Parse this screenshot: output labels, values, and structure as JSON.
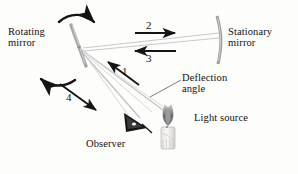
{
  "figure": {
    "type": "optics-diagram",
    "title_visible": false,
    "background_color": "#fdfdfc",
    "ink_color": "#111111",
    "ray_color": "#b9b9b9",
    "mirror_color": "#9a9a9a"
  },
  "labels": {
    "rotating_mirror": "Rotating\nmirror",
    "stationary_mirror": "Stationary\nmirror",
    "deflection_angle": "Deflection\nangle",
    "light_source": "Light source",
    "observer": "Observer"
  },
  "ray_numbers": {
    "one": "1",
    "two": "2",
    "three": "3",
    "four": "4"
  },
  "icons": {
    "rotating_mirror": "rotating-mirror-icon",
    "stationary_mirror": "stationary-mirror-icon",
    "candle": "candle-light-source-icon",
    "eye": "observer-eye-icon",
    "rotation_arrow_top": "curved-arrow-right-icon",
    "rotation_arrow_bottom": "curved-arrow-left-icon"
  }
}
